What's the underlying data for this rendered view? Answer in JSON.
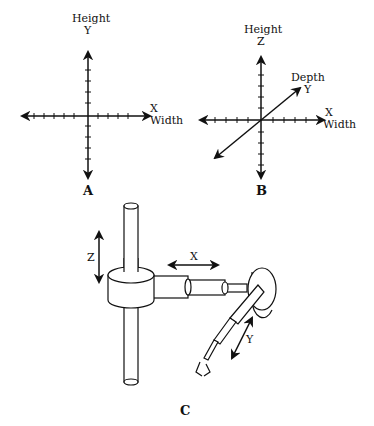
{
  "figure_a": {
    "caption": "A",
    "vertical_axis": {
      "name": "Height",
      "letter": "Y"
    },
    "horizontal_axis": {
      "name": "Width",
      "letter": "X"
    }
  },
  "figure_b": {
    "caption": "B",
    "vertical_axis": {
      "name": "Height",
      "letter": "Z"
    },
    "depth_axis": {
      "name": "Depth",
      "letter": "Y"
    },
    "horizontal_axis": {
      "name": "Width",
      "letter": "X"
    }
  },
  "figure_c": {
    "caption": "C",
    "labels": {
      "z": "Z",
      "x": "X",
      "y": "Y"
    }
  }
}
